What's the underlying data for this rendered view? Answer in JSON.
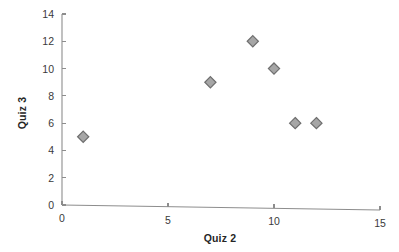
{
  "chart_data": {
    "type": "scatter",
    "title": "",
    "subtitle": "",
    "xlabel": "Quiz 2",
    "ylabel": "Quiz 3",
    "xlim": [
      0,
      15
    ],
    "ylim": [
      0,
      14
    ],
    "xticks": [
      "0",
      "5",
      "10",
      "15"
    ],
    "xtick_values": [
      0,
      5,
      10,
      15
    ],
    "yticks": [
      "0",
      "2",
      "4",
      "6",
      "8",
      "10",
      "12",
      "14"
    ],
    "ytick_values": [
      0,
      2,
      4,
      6,
      8,
      10,
      12,
      14
    ],
    "grid": false,
    "legend": false,
    "legend_position": "none",
    "marker": "diamond",
    "marker_color": "#a6a6a6",
    "marker_edge_color": "#6e6e6e",
    "axis_color": "#8d8d8d",
    "points": [
      {
        "x": 1,
        "y": 5
      },
      {
        "x": 7,
        "y": 9
      },
      {
        "x": 9,
        "y": 12
      },
      {
        "x": 10,
        "y": 10
      },
      {
        "x": 11,
        "y": 6
      },
      {
        "x": 12,
        "y": 6
      }
    ],
    "series": [
      {
        "name": "Quiz 3 vs Quiz 2",
        "x": [
          1,
          7,
          9,
          10,
          11,
          12
        ],
        "values": [
          5,
          9,
          12,
          10,
          6,
          6
        ]
      }
    ]
  }
}
